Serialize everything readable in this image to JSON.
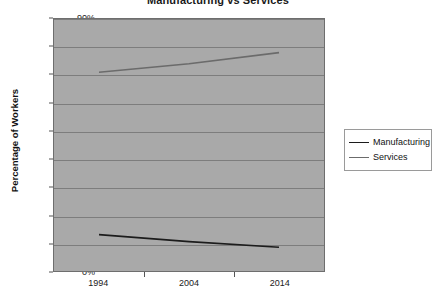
{
  "chart_data": {
    "type": "line",
    "title": "Manufacturing vs Services",
    "xlabel": "",
    "ylabel": "Percentage of Workers",
    "x": [
      "1994",
      "2004",
      "2014"
    ],
    "categories": [
      "1994",
      "2004",
      "2014"
    ],
    "series": [
      {
        "name": "Manufacturing",
        "color": "#1c1c1c",
        "values": [
          13,
          10.5,
          8.5
        ]
      },
      {
        "name": "Services",
        "color": "#6b6b6b",
        "values": [
          71,
          74,
          78
        ]
      }
    ],
    "ylim": [
      0,
      90
    ],
    "ytick_labels": [
      "0%",
      "10%",
      "20%",
      "30%",
      "40%",
      "50%",
      "60%",
      "70%",
      "80%",
      "90%"
    ],
    "ytick_values": [
      0,
      10,
      20,
      30,
      40,
      50,
      60,
      70,
      80,
      90
    ],
    "grid": "horizontal",
    "legend_position": "right",
    "plot_background": "#a9a9a9",
    "grid_color": "#7d7d7d",
    "figure_background": "#ffffff"
  },
  "legend": {
    "entries": [
      {
        "label": "Manufacturing",
        "color": "#1c1c1c"
      },
      {
        "label": "Services",
        "color": "#6b6b6b"
      }
    ]
  }
}
